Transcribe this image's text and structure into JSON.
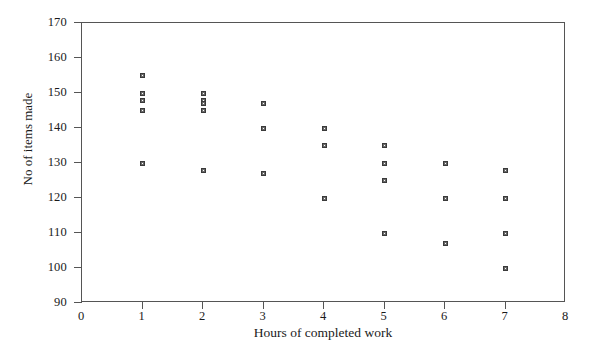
{
  "chart_data": {
    "type": "scatter",
    "title": "",
    "xlabel": "Hours of completed work",
    "ylabel": "No of items made",
    "xlim": [
      0,
      8
    ],
    "ylim": [
      90,
      170
    ],
    "xticks": [
      0,
      1,
      2,
      3,
      4,
      5,
      6,
      7,
      8
    ],
    "yticks": [
      90,
      100,
      110,
      120,
      130,
      140,
      150,
      160,
      170
    ],
    "xtick_labels": [
      "0",
      "1",
      "2",
      "3",
      "4",
      "5",
      "6",
      "7",
      "8"
    ],
    "ytick_labels": [
      "90",
      "100",
      "110",
      "120",
      "130",
      "140",
      "150",
      "160",
      "170"
    ],
    "grid": false,
    "legend": null,
    "marker_style": "square-cross",
    "marker_color": "#4a4a4a",
    "frame_color": "#555555",
    "background_color": "#ffffff",
    "points": [
      {
        "x": 1,
        "y": 155
      },
      {
        "x": 1,
        "y": 150
      },
      {
        "x": 1,
        "y": 148
      },
      {
        "x": 1,
        "y": 145
      },
      {
        "x": 1,
        "y": 130
      },
      {
        "x": 2,
        "y": 150
      },
      {
        "x": 2,
        "y": 148
      },
      {
        "x": 2,
        "y": 147
      },
      {
        "x": 2,
        "y": 145
      },
      {
        "x": 2,
        "y": 128
      },
      {
        "x": 3,
        "y": 147
      },
      {
        "x": 3,
        "y": 140
      },
      {
        "x": 3,
        "y": 127
      },
      {
        "x": 4,
        "y": 140
      },
      {
        "x": 4,
        "y": 135
      },
      {
        "x": 4,
        "y": 120
      },
      {
        "x": 5,
        "y": 135
      },
      {
        "x": 5,
        "y": 130
      },
      {
        "x": 5,
        "y": 125
      },
      {
        "x": 5,
        "y": 110
      },
      {
        "x": 6,
        "y": 130
      },
      {
        "x": 6,
        "y": 120
      },
      {
        "x": 6,
        "y": 107
      },
      {
        "x": 7,
        "y": 128
      },
      {
        "x": 7,
        "y": 120
      },
      {
        "x": 7,
        "y": 110
      },
      {
        "x": 7,
        "y": 100
      }
    ]
  }
}
